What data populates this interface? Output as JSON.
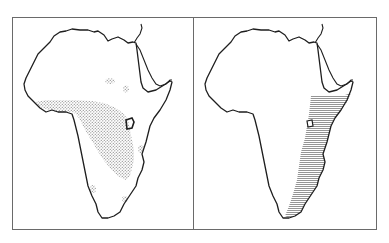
{
  "figure": {
    "panel_count": 2,
    "colors": {
      "background": "#ffffff",
      "frame": "#6a6a6a",
      "coastline": "#1e1e1e",
      "stipple": "#8a8a8a",
      "hatch": "#7a7a7a"
    },
    "panels": [
      {
        "id": "left",
        "subject": "africa-map",
        "fill_pattern": "stipple",
        "region": "central-africa-distribution",
        "extra_patches": 5
      },
      {
        "id": "right",
        "subject": "africa-map",
        "fill_pattern": "horizontal-hatch",
        "region": "east-african-coast-distribution",
        "extra_patches": 0
      }
    ]
  }
}
